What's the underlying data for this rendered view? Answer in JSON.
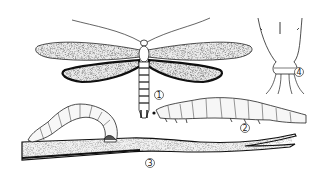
{
  "figure": {
    "type": "scientific-illustration",
    "style": "black-and-white line drawing",
    "subjects": [
      {
        "id": "adult-moth",
        "label": "1",
        "description": "adult moth with wings spread"
      },
      {
        "id": "larva",
        "label": "2",
        "description": "larva (caterpillar), side view"
      },
      {
        "id": "larva-on-stem",
        "label": "3",
        "description": "arched larva on a plant stem"
      },
      {
        "id": "abdomen-tip",
        "label": "4",
        "description": "detail of abdomen tip"
      }
    ]
  },
  "colors": {
    "background": "#ffffff",
    "ink": "#1a1a1a",
    "wing_fill": "#e6e6e6"
  }
}
